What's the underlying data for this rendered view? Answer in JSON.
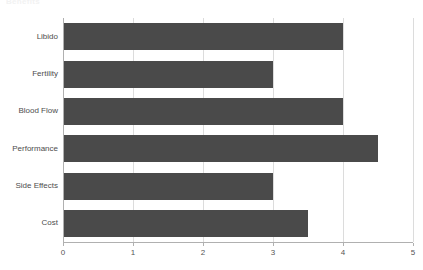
{
  "chart_data": {
    "type": "bar",
    "orientation": "horizontal",
    "title": "",
    "title_fragment": "Benefits",
    "xlabel": "",
    "ylabel": "",
    "categories": [
      "Libido",
      "Fertility",
      "Blood Flow",
      "Performance",
      "Side Effects",
      "Cost"
    ],
    "values": [
      4.0,
      3.0,
      4.0,
      4.5,
      3.0,
      3.5
    ],
    "xlim": [
      0,
      5
    ],
    "xticks": [
      "0",
      "1",
      "2",
      "3",
      "4",
      "5"
    ],
    "xtick_values": [
      0,
      1,
      2,
      3,
      4,
      5
    ],
    "grid": true,
    "grid_axis": "x",
    "legend": false,
    "bar_color": "#4a4a4a",
    "grid_color": "#dcdcdc",
    "axis_color": "#b0b0b0",
    "background_color": "#ffffff",
    "label_color": "#4d4d4d"
  }
}
